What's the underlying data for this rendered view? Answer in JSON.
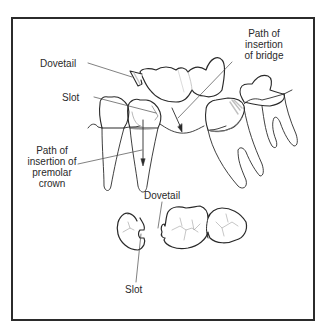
{
  "figure": {
    "colors": {
      "frame": "#2b2b2b",
      "outline": "#2a2a2a",
      "leader": "#4a4a4a",
      "fissure": "#9a9a9a",
      "shade": "#c8c8c8"
    },
    "side_view": {
      "labels": {
        "dovetail": "Dovetail",
        "slot": "Slot",
        "bridge_path_line1": "Path of",
        "bridge_path_line2": "insertion",
        "bridge_path_line3": "of bridge",
        "premolar_path_line1": "Path of",
        "premolar_path_line2": "insertion of",
        "premolar_path_line3": "premolar",
        "premolar_path_line4": "crown"
      }
    },
    "occlusal_view": {
      "labels": {
        "dovetail": "Dovetail",
        "slot": "Slot"
      }
    }
  }
}
